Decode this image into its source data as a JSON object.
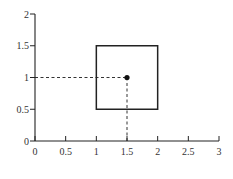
{
  "chart_data": {
    "type": "scatter",
    "title": "",
    "xlabel": "",
    "ylabel": "",
    "xlim": [
      0,
      3
    ],
    "ylim": [
      0,
      2
    ],
    "grid": false,
    "x_ticks": [
      {
        "value": 0,
        "label": "0"
      },
      {
        "value": 0.5,
        "label": "0.5"
      },
      {
        "value": 1,
        "label": "1"
      },
      {
        "value": 1.5,
        "label": "1.5"
      },
      {
        "value": 2,
        "label": "2"
      },
      {
        "value": 2.5,
        "label": "2.5"
      },
      {
        "value": 3,
        "label": "3"
      }
    ],
    "y_ticks": [
      {
        "value": 0,
        "label": "0"
      },
      {
        "value": 0.5,
        "label": "0.5"
      },
      {
        "value": 1,
        "label": "1"
      },
      {
        "value": 1.5,
        "label": "1.5"
      },
      {
        "value": 2,
        "label": "2"
      }
    ],
    "shapes": [
      {
        "kind": "square",
        "x0": 1,
        "y0": 0.5,
        "x1": 2,
        "y1": 1.5
      }
    ],
    "points": [
      {
        "x": 1.5,
        "y": 1
      }
    ],
    "guides": [
      {
        "kind": "horizontal-dashed",
        "from": [
          0,
          1
        ],
        "to": [
          1.5,
          1
        ]
      },
      {
        "kind": "vertical-dashed",
        "from": [
          1.5,
          0
        ],
        "to": [
          1.5,
          1
        ]
      }
    ]
  }
}
